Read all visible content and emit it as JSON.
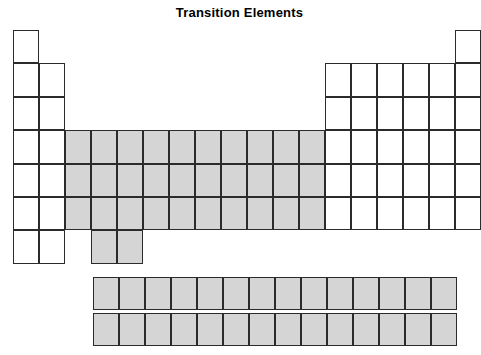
{
  "figure": {
    "title": "Transition Elements",
    "type": "periodic-table-outline",
    "colors": {
      "shaded_fill": "#d5d5d5",
      "unshaded_fill": "#ffffff",
      "cell_border": "#2b2b2b",
      "title_color": "#000000",
      "background": "#ffffff"
    },
    "geometry": {
      "cell_width": 26,
      "cell_height": 33.4,
      "main_grid_left": 13,
      "main_grid_top": 30,
      "groups": 18,
      "periods": 7,
      "fblock_left": 93,
      "fblock_row1_top": 277,
      "fblock_row2_top": 313,
      "fblock_columns": 14,
      "fblock_rows": 2
    },
    "main_grid": [
      {
        "period": 1,
        "cells": [
          {
            "group": 1,
            "shaded": false
          },
          {
            "group": 18,
            "shaded": false
          }
        ]
      },
      {
        "period": 2,
        "cells": [
          {
            "group": 1,
            "shaded": false
          },
          {
            "group": 2,
            "shaded": false
          },
          {
            "group": 13,
            "shaded": false
          },
          {
            "group": 14,
            "shaded": false
          },
          {
            "group": 15,
            "shaded": false
          },
          {
            "group": 16,
            "shaded": false
          },
          {
            "group": 17,
            "shaded": false
          },
          {
            "group": 18,
            "shaded": false
          }
        ]
      },
      {
        "period": 3,
        "cells": [
          {
            "group": 1,
            "shaded": false
          },
          {
            "group": 2,
            "shaded": false
          },
          {
            "group": 13,
            "shaded": false
          },
          {
            "group": 14,
            "shaded": false
          },
          {
            "group": 15,
            "shaded": false
          },
          {
            "group": 16,
            "shaded": false
          },
          {
            "group": 17,
            "shaded": false
          },
          {
            "group": 18,
            "shaded": false
          }
        ]
      },
      {
        "period": 4,
        "cells": [
          {
            "group": 1,
            "shaded": false
          },
          {
            "group": 2,
            "shaded": false
          },
          {
            "group": 3,
            "shaded": true
          },
          {
            "group": 4,
            "shaded": true
          },
          {
            "group": 5,
            "shaded": true
          },
          {
            "group": 6,
            "shaded": true
          },
          {
            "group": 7,
            "shaded": true
          },
          {
            "group": 8,
            "shaded": true
          },
          {
            "group": 9,
            "shaded": true
          },
          {
            "group": 10,
            "shaded": true
          },
          {
            "group": 11,
            "shaded": true
          },
          {
            "group": 12,
            "shaded": true
          },
          {
            "group": 13,
            "shaded": false
          },
          {
            "group": 14,
            "shaded": false
          },
          {
            "group": 15,
            "shaded": false
          },
          {
            "group": 16,
            "shaded": false
          },
          {
            "group": 17,
            "shaded": false
          },
          {
            "group": 18,
            "shaded": false
          }
        ]
      },
      {
        "period": 5,
        "cells": [
          {
            "group": 1,
            "shaded": false
          },
          {
            "group": 2,
            "shaded": false
          },
          {
            "group": 3,
            "shaded": true
          },
          {
            "group": 4,
            "shaded": true
          },
          {
            "group": 5,
            "shaded": true
          },
          {
            "group": 6,
            "shaded": true
          },
          {
            "group": 7,
            "shaded": true
          },
          {
            "group": 8,
            "shaded": true
          },
          {
            "group": 9,
            "shaded": true
          },
          {
            "group": 10,
            "shaded": true
          },
          {
            "group": 11,
            "shaded": true
          },
          {
            "group": 12,
            "shaded": true
          },
          {
            "group": 13,
            "shaded": false
          },
          {
            "group": 14,
            "shaded": false
          },
          {
            "group": 15,
            "shaded": false
          },
          {
            "group": 16,
            "shaded": false
          },
          {
            "group": 17,
            "shaded": false
          },
          {
            "group": 18,
            "shaded": false
          }
        ]
      },
      {
        "period": 6,
        "cells": [
          {
            "group": 1,
            "shaded": false
          },
          {
            "group": 2,
            "shaded": false
          },
          {
            "group": 3,
            "shaded": true
          },
          {
            "group": 4,
            "shaded": true
          },
          {
            "group": 5,
            "shaded": true
          },
          {
            "group": 6,
            "shaded": true
          },
          {
            "group": 7,
            "shaded": true
          },
          {
            "group": 8,
            "shaded": true
          },
          {
            "group": 9,
            "shaded": true
          },
          {
            "group": 10,
            "shaded": true
          },
          {
            "group": 11,
            "shaded": true
          },
          {
            "group": 12,
            "shaded": true
          },
          {
            "group": 13,
            "shaded": false
          },
          {
            "group": 14,
            "shaded": false
          },
          {
            "group": 15,
            "shaded": false
          },
          {
            "group": 16,
            "shaded": false
          },
          {
            "group": 17,
            "shaded": false
          },
          {
            "group": 18,
            "shaded": false
          }
        ]
      },
      {
        "period": 7,
        "cells": [
          {
            "group": 1,
            "shaded": false
          },
          {
            "group": 2,
            "shaded": false
          },
          {
            "group": 4,
            "shaded": true
          },
          {
            "group": 5,
            "shaded": true
          }
        ]
      }
    ],
    "fblock": [
      {
        "row": 1,
        "cells": [
          {
            "index": 1,
            "shaded": true
          },
          {
            "index": 2,
            "shaded": true
          },
          {
            "index": 3,
            "shaded": true
          },
          {
            "index": 4,
            "shaded": true
          },
          {
            "index": 5,
            "shaded": true
          },
          {
            "index": 6,
            "shaded": true
          },
          {
            "index": 7,
            "shaded": true
          },
          {
            "index": 8,
            "shaded": true
          },
          {
            "index": 9,
            "shaded": true
          },
          {
            "index": 10,
            "shaded": true
          },
          {
            "index": 11,
            "shaded": true
          },
          {
            "index": 12,
            "shaded": true
          },
          {
            "index": 13,
            "shaded": true
          },
          {
            "index": 14,
            "shaded": true
          }
        ]
      },
      {
        "row": 2,
        "cells": [
          {
            "index": 1,
            "shaded": true
          },
          {
            "index": 2,
            "shaded": true
          },
          {
            "index": 3,
            "shaded": true
          },
          {
            "index": 4,
            "shaded": true
          },
          {
            "index": 5,
            "shaded": true
          },
          {
            "index": 6,
            "shaded": true
          },
          {
            "index": 7,
            "shaded": true
          },
          {
            "index": 8,
            "shaded": true
          },
          {
            "index": 9,
            "shaded": true
          },
          {
            "index": 10,
            "shaded": true
          },
          {
            "index": 11,
            "shaded": true
          },
          {
            "index": 12,
            "shaded": true
          },
          {
            "index": 13,
            "shaded": true
          },
          {
            "index": 14,
            "shaded": true
          }
        ]
      }
    ]
  }
}
